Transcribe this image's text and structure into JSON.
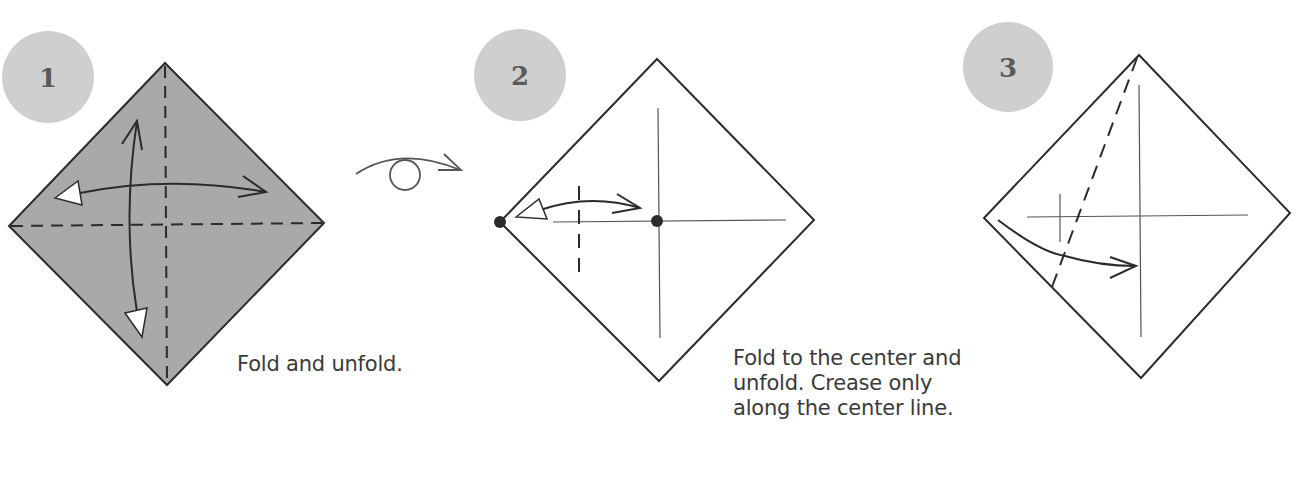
{
  "steps": [
    {
      "number": "1",
      "caption": "Fold and unfold.",
      "paper_color": "#a9a9a9",
      "badge_color": "#cfcfcf"
    },
    {
      "number": "2",
      "caption_lines": [
        "Fold to the center and",
        "unfold. Crease only",
        "along the center line."
      ],
      "paper_color": "#ffffff",
      "badge_color": "#cfcfcf"
    },
    {
      "number": "3",
      "paper_color": "#ffffff",
      "badge_color": "#cfcfcf"
    }
  ],
  "symbols": {
    "turn_over": "turn-over-icon"
  },
  "colors": {
    "line": "#2b2b2b",
    "crease": "#555555",
    "text": "#3a3a3a"
  }
}
